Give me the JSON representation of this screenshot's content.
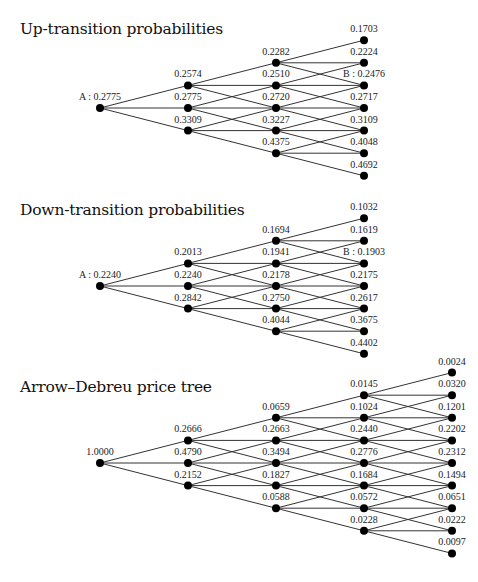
{
  "trees": [
    {
      "title": "Up-transition probabilities",
      "top": 20,
      "root": {
        "x": 100,
        "y": 108
      },
      "dx": 88,
      "dy": 22.6,
      "levels": [
        [
          "A : 0.2775"
        ],
        [
          "0.2574",
          "0.2775",
          "0.3309"
        ],
        [
          "0.2282",
          "0.2510",
          "0.2720",
          "0.3227",
          "0.4375"
        ],
        [
          "0.1703",
          "0.2224",
          "B : 0.2476",
          "0.2717",
          "0.3109",
          "0.4048",
          "0.4692"
        ]
      ]
    },
    {
      "title": "Down-transition probabilities",
      "top": 201,
      "root": {
        "x": 100,
        "y": 286
      },
      "dx": 88,
      "dy": 22.6,
      "levels": [
        [
          "A : 0.2240"
        ],
        [
          "0.2013",
          "0.2240",
          "0.2842"
        ],
        [
          "0.1694",
          "0.1941",
          "0.2178",
          "0.2750",
          "0.4044"
        ],
        [
          "0.1032",
          "0.1619",
          "B : 0.1903",
          "0.2175",
          "0.2617",
          "0.3675",
          "0.4402"
        ]
      ]
    },
    {
      "title": "Arrow–Debreu price tree",
      "top": 378,
      "root": {
        "x": 100,
        "y": 463
      },
      "dx": 88,
      "dy": 22.6,
      "levels": [
        [
          "1.0000"
        ],
        [
          "0.2666",
          "0.4790",
          "0.2152"
        ],
        [
          "0.0659",
          "0.2663",
          "0.3494",
          "0.1827",
          "0.0588"
        ],
        [
          "0.0145",
          "0.1024",
          "0.2440",
          "0.2776",
          "0.1684",
          "0.0572",
          "0.0228"
        ],
        [
          "0.0024",
          "0.0320",
          "0.1201",
          "0.2202",
          "0.2312",
          "0.1494",
          "0.0651",
          "0.0222",
          "0.0097"
        ]
      ]
    }
  ],
  "colors": {
    "line": "#333333",
    "node": "#000000",
    "text": "#222222"
  }
}
